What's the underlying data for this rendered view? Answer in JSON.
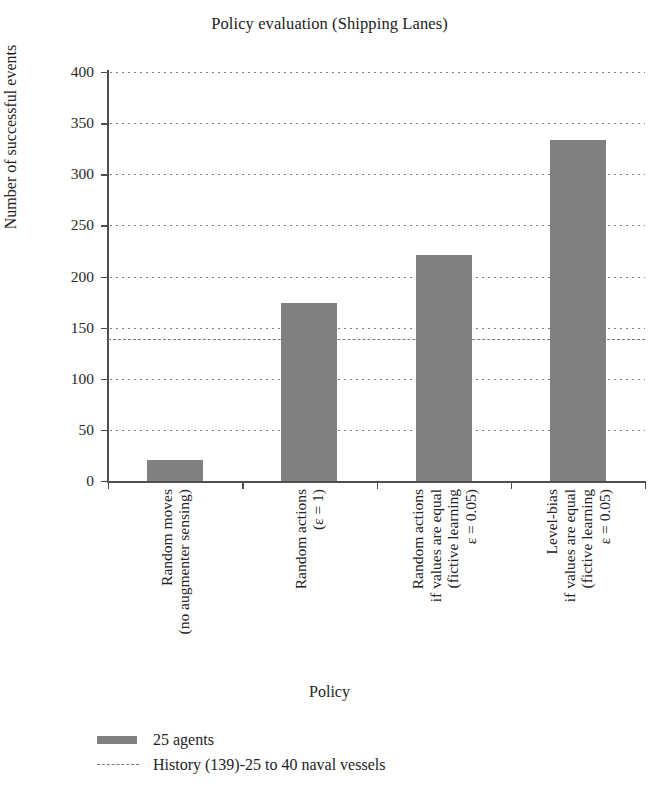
{
  "chart_data": {
    "type": "bar",
    "title": "Policy evaluation (Shipping Lanes)",
    "xlabel": "Policy",
    "ylabel": "Number of successful events",
    "ylim": [
      0,
      400
    ],
    "ytick_step": 50,
    "yticks": [
      0,
      50,
      100,
      150,
      200,
      250,
      300,
      350,
      400
    ],
    "ytick_labels": [
      "0",
      "50",
      "100",
      "150",
      "200",
      "250",
      "300",
      "350",
      "400"
    ],
    "grid": "dotted-horizontal",
    "legend_position": "below-axes-left",
    "bar_color": "#808080",
    "reference_line_color": "#7a7a7a",
    "categories": [
      "Random moves (no augmenter sensing)",
      "Random actions (ε = 1)",
      "Random actions if values are equal (fictive learning ε = 0.05)",
      "Level-bias if values are equal (fictive learning ε = 0.05)"
    ],
    "category_lines": [
      [
        "Random moves",
        "(no augmenter sensing)"
      ],
      [
        "Random actions",
        "(ε = 1)"
      ],
      [
        "Random actions",
        "if values are equal",
        "(fictive learning",
        "ε = 0.05)"
      ],
      [
        "Level-bias",
        "if values are equal",
        "(fictive learning",
        "ε = 0.05)"
      ]
    ],
    "series": [
      {
        "name": "25 agents",
        "values": [
          21,
          174,
          221,
          334
        ]
      }
    ],
    "annotations": [
      {
        "type": "horizontal-reference-line",
        "label": "History (139)-25 to 40 naval vessels",
        "value": 139,
        "style": "dashed"
      }
    ],
    "legend": [
      {
        "label": "25 agents",
        "marker": "bar-swatch",
        "color": "#808080"
      },
      {
        "label": "History (139)-25 to 40 naval vessels",
        "marker": "dashed-line",
        "color": "#7a7a7a"
      }
    ]
  }
}
